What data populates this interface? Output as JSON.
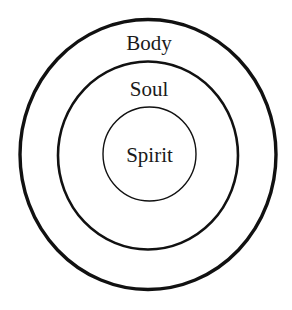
{
  "diagram": {
    "type": "concentric-circles",
    "layers": [
      {
        "label": "Body",
        "position": "outer"
      },
      {
        "label": "Soul",
        "position": "middle"
      },
      {
        "label": "Spirit",
        "position": "inner"
      }
    ],
    "colors": {
      "stroke": "#111111",
      "text": "#1a1a1a",
      "background": "#ffffff"
    }
  }
}
